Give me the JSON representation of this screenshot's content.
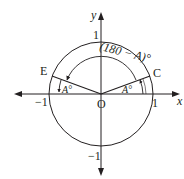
{
  "diagram": {
    "type": "unit-circle",
    "colors": {
      "stroke": "#231f20",
      "background": "#ffffff"
    },
    "axes": {
      "x_label": "x",
      "y_label": "y",
      "x_ticks": {
        "neg": "−1",
        "pos": "1"
      },
      "y_ticks": {
        "pos": "1",
        "neg": "−1"
      }
    },
    "points": {
      "origin": "O",
      "c": "C",
      "e": "E"
    },
    "angles": {
      "large_angle": "(180 − A)°",
      "angle_at_c": "A°",
      "angle_at_e": "A°"
    }
  }
}
